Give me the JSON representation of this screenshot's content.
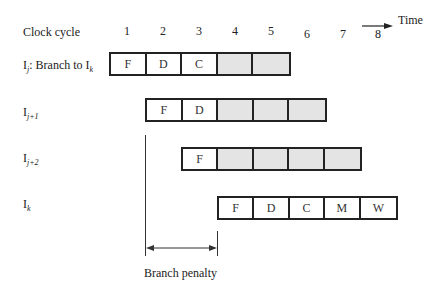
{
  "header": {
    "clock_cycle_label": "Clock cycle",
    "time_label": "Time",
    "cycles": [
      "1",
      "2",
      "3",
      "4",
      "5",
      "6",
      "7",
      "8"
    ]
  },
  "rows": [
    {
      "label_main": "I",
      "label_sub": "j",
      "label_rest": ": Branch to I",
      "label_sub2": "k",
      "start_cycle": 1,
      "stages": [
        {
          "text": "F",
          "stall": false
        },
        {
          "text": "D",
          "stall": false
        },
        {
          "text": "C",
          "stall": false
        },
        {
          "text": "",
          "stall": true
        },
        {
          "text": "",
          "stall": true
        }
      ]
    },
    {
      "label_main": "I",
      "label_sub": "j+1",
      "start_cycle": 2,
      "stages": [
        {
          "text": "F",
          "stall": false
        },
        {
          "text": "D",
          "stall": false
        },
        {
          "text": "",
          "stall": true
        },
        {
          "text": "",
          "stall": true
        },
        {
          "text": "",
          "stall": true
        }
      ]
    },
    {
      "label_main": "I",
      "label_sub": "j+2",
      "start_cycle": 3,
      "stages": [
        {
          "text": "F",
          "stall": false
        },
        {
          "text": "",
          "stall": true
        },
        {
          "text": "",
          "stall": true
        },
        {
          "text": "",
          "stall": true
        },
        {
          "text": "",
          "stall": true
        }
      ]
    },
    {
      "label_main": "I",
      "label_sub": "k",
      "start_cycle": 4,
      "stages": [
        {
          "text": "F",
          "stall": false
        },
        {
          "text": "D",
          "stall": false
        },
        {
          "text": "C",
          "stall": false
        },
        {
          "text": "M",
          "stall": false
        },
        {
          "text": "W",
          "stall": false
        }
      ]
    }
  ],
  "annotation": {
    "branch_penalty_label": "Branch penalty",
    "penalty_cycles": 2
  },
  "colors": {
    "stall_fill": "#e4e4e4",
    "border": "#222222"
  }
}
